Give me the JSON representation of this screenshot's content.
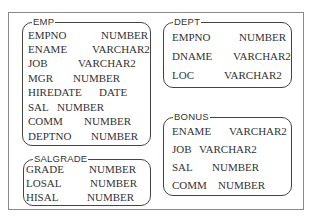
{
  "tables": {
    "emp": {
      "name": "EMP",
      "columns": [
        {
          "name": "EMPNO",
          "type": "NUMBER"
        },
        {
          "name": "ENAME",
          "type": "VARCHAR2"
        },
        {
          "name": "JOB",
          "type": "VARCHAR2"
        },
        {
          "name": "MGR",
          "type": "NUMBER"
        },
        {
          "name": "HIREDATE",
          "type": "DATE"
        },
        {
          "name": "SAL",
          "type": "NUMBER"
        },
        {
          "name": "COMM",
          "type": "NUMBER"
        },
        {
          "name": "DEPTNO",
          "type": "NUMBER"
        }
      ]
    },
    "dept": {
      "name": "DEPT",
      "columns": [
        {
          "name": "EMPNO",
          "type": "NUMBER"
        },
        {
          "name": "DNAME",
          "type": "VARCHAR2"
        },
        {
          "name": "LOC",
          "type": "VARCHAR2"
        }
      ]
    },
    "salgrade": {
      "name": "SALGRADE",
      "columns": [
        {
          "name": "GRADE",
          "type": "NUMBER"
        },
        {
          "name": "LOSAL",
          "type": "NUMBER"
        },
        {
          "name": "HISAL",
          "type": "NUMBER"
        }
      ]
    },
    "bonus": {
      "name": "BONUS",
      "columns": [
        {
          "name": "ENAME",
          "type": "VARCHAR2"
        },
        {
          "name": "JOB",
          "type": "VARCHAR2"
        },
        {
          "name": "SAL",
          "type": "NUMBER"
        },
        {
          "name": "COMM",
          "type": "NUMBER"
        }
      ]
    }
  }
}
